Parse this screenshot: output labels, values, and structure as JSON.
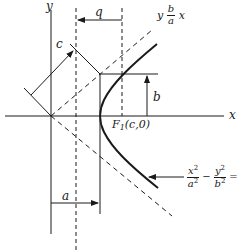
{
  "diagram": {
    "axes": {
      "x_label": "x",
      "y_label": "y"
    },
    "labels": {
      "c": "c",
      "q": "q",
      "b": "b",
      "a": "a",
      "focus": "F",
      "focus_sub": "1",
      "focus_coords": "(c,0)",
      "asymptote_y": "y",
      "asymptote_num": "b",
      "asymptote_den": "a",
      "asymptote_x": "x",
      "eq_x_num": "x",
      "eq_x_den": "a",
      "eq_y_num": "y",
      "eq_y_den": "b",
      "eq_exp": "2",
      "eq_minus": "−",
      "eq_rhs": "= 1"
    },
    "colors": {
      "ink": "#1a1a1a",
      "background": "#ffffff"
    }
  }
}
